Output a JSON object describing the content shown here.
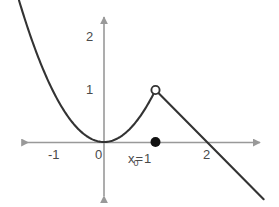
{
  "figure": {
    "title": "",
    "background_color": "#ffffff",
    "axis_color": "#999999",
    "curve_color": "#333333",
    "label_color": "#4a4a4a"
  },
  "annotation": {
    "variable": "x",
    "subscript": "0",
    "equals": "=",
    "value": "1",
    "full_text": "x₀ = 1"
  },
  "axes": {
    "x_ticks": [
      "-1",
      "0",
      "2"
    ],
    "y_ticks": [
      "1",
      "2"
    ],
    "x_tick_label_neg1": "-1",
    "x_tick_label_0": "0",
    "x_tick_label_2": "2",
    "y_tick_label_1": "1",
    "y_tick_label_2": "2"
  },
  "chart_data": {
    "type": "line",
    "title": "",
    "xlabel": "",
    "ylabel": "",
    "xlim": [
      -1.65,
      3.1
    ],
    "ylim": [
      -1.1,
      2.45
    ],
    "grid": false,
    "legend": false,
    "x_tick_values": [
      -1,
      0,
      2
    ],
    "x_tick_labels": [
      "-1",
      "0",
      "2"
    ],
    "y_tick_values": [
      1,
      2
    ],
    "y_tick_labels": [
      "1",
      "2"
    ],
    "series": [
      {
        "name": "parabola-branch",
        "expression": "y = x^2",
        "domain": [
          -1.65,
          1
        ],
        "style": "solid",
        "color": "#333333",
        "endpoint_right": {
          "x": 1,
          "y": 1,
          "marker": "open-circle"
        },
        "points": [
          {
            "x": -1.65,
            "y": 2.72
          },
          {
            "x": -1.5,
            "y": 2.25
          },
          {
            "x": -1.25,
            "y": 1.5625
          },
          {
            "x": -1.0,
            "y": 1.0
          },
          {
            "x": -0.75,
            "y": 0.5625
          },
          {
            "x": -0.5,
            "y": 0.25
          },
          {
            "x": -0.25,
            "y": 0.0625
          },
          {
            "x": 0.0,
            "y": 0.0
          },
          {
            "x": 0.25,
            "y": 0.0625
          },
          {
            "x": 0.5,
            "y": 0.25
          },
          {
            "x": 0.75,
            "y": 0.5625
          },
          {
            "x": 1.0,
            "y": 1.0
          }
        ]
      },
      {
        "name": "line-branch",
        "expression": "y = 2 - x",
        "domain": [
          1,
          3.1
        ],
        "style": "solid",
        "color": "#333333",
        "points": [
          {
            "x": 1.0,
            "y": 1.0
          },
          {
            "x": 2.0,
            "y": 0.0
          },
          {
            "x": 3.1,
            "y": -1.1
          }
        ]
      }
    ],
    "markers": [
      {
        "name": "open-circle-at-peak",
        "x": 1,
        "y": 1,
        "filled": false,
        "color": "#333333",
        "description": "hollow circle marking removed value at x=1"
      },
      {
        "name": "filled-dot-on-x-axis",
        "x": 1,
        "y": 0,
        "filled": true,
        "color": "#000000",
        "description": "solid dot marking x-naught on the x-axis"
      }
    ],
    "annotations": [
      {
        "text": "x₀ = 1",
        "x": 1,
        "y": -0.28,
        "anchor": "center"
      }
    ]
  }
}
